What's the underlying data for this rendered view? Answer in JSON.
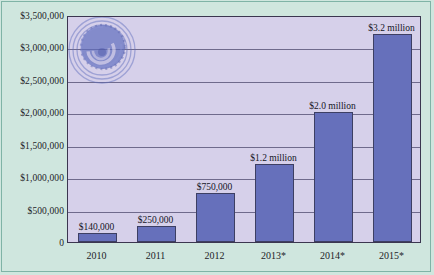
{
  "chart_data": {
    "type": "bar",
    "title": "",
    "xlabel": "",
    "ylabel": "",
    "categories": [
      "2010",
      "2011",
      "2012",
      "2013*",
      "2014*",
      "2015*"
    ],
    "values": [
      140000,
      250000,
      750000,
      1200000,
      2000000,
      3200000
    ],
    "data_labels": [
      "$140,000",
      "$250,000",
      "$750,000",
      "$1.2 million",
      "$2.0 million",
      "$3.2 million"
    ],
    "ylim": [
      0,
      3500000
    ],
    "ytick_values": [
      0,
      500000,
      1000000,
      1500000,
      2000000,
      2500000,
      3000000,
      3500000
    ],
    "ytick_labels": [
      "0",
      "$500,000",
      "$1,000,000",
      "$1,500,000",
      "$2,000,000",
      "$2,500,000",
      "$3,000,000",
      "$3,500,000"
    ],
    "grid": true,
    "legend": false,
    "legend_position": "none",
    "series": [
      {
        "name": "Revenue",
        "values": [
          140000,
          250000,
          750000,
          1200000,
          2000000,
          3200000
        ]
      }
    ]
  },
  "style": {
    "background_color": "#cfe6de",
    "plot_background_color": "#d6d0ea",
    "bar_color": "#6670bb",
    "bar_border_color": "#3d3f63",
    "gridline_color": "#6f6a8c",
    "axis_color": "#3b3650",
    "frame_color": "#7fb3a6",
    "text_color": "#1d1d28"
  },
  "watermark": {
    "name": "spiral-logo-watermark",
    "color": "#5f6dbe"
  }
}
